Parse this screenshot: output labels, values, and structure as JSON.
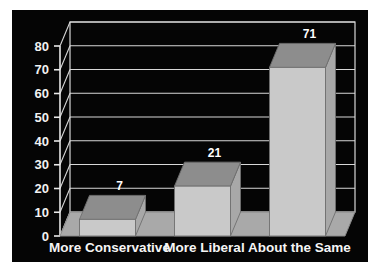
{
  "chart_data": {
    "type": "bar",
    "title": "",
    "subtitle": "",
    "xlabel": "",
    "ylabel": "",
    "categories": [
      "More Conservative",
      "More Liberal",
      "About the Same"
    ],
    "values": [
      7,
      21,
      71
    ],
    "data_labels": [
      "7",
      "21",
      "71"
    ],
    "ylim": [
      0,
      80
    ],
    "ytick_step": 10,
    "ytick_labels": [
      "0",
      "10",
      "20",
      "30",
      "40",
      "50",
      "60",
      "70",
      "80"
    ],
    "grid": true,
    "legend": "none",
    "projection": "3d",
    "series": [
      {
        "name": "Responses",
        "values": [
          7,
          21,
          71
        ]
      }
    ]
  },
  "style": {
    "plot_background": "#050505",
    "page_background": "#ffffff",
    "gridline_color": "#d8d8d8",
    "axis_color": "#e8e8e8",
    "bar_front": "#c9c9c9",
    "bar_top": "#8d8d8d",
    "bar_side": "#a8a8a8",
    "floor_color": "#a9a9a9",
    "floor_edge": "#8a8a8a",
    "tick_text": "#f2f2f2",
    "label_text": "#f5f5f5"
  }
}
